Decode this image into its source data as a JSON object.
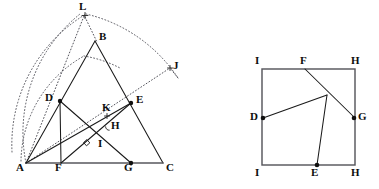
{
  "figure": {
    "width": 379,
    "height": 189,
    "background_color": "#ffffff",
    "line_color": "#1a1a1a",
    "dotted_color": "#4a4a52",
    "edge_color": "#57575d",
    "marker_color": "#101010"
  },
  "left_panel": {
    "name": "triangle-construction",
    "description": "Triangle ABC with interior cevians, dotted circular arcs centred at A, and construction points",
    "points": [
      {
        "id": "A",
        "label": "A",
        "x": 26,
        "y": 163,
        "marker": "none",
        "label_x": 16,
        "label_y": 166
      },
      {
        "id": "B",
        "label": "B",
        "x": 95,
        "y": 41,
        "marker": "none",
        "label_x": 99,
        "label_y": 35
      },
      {
        "id": "C",
        "label": "C",
        "x": 163,
        "y": 163,
        "marker": "none",
        "label_x": 166,
        "label_y": 166
      },
      {
        "id": "D",
        "label": "D",
        "x": 60,
        "y": 101,
        "marker": "dot",
        "label_x": 46,
        "label_y": 96
      },
      {
        "id": "E",
        "label": "E",
        "x": 131,
        "y": 103,
        "marker": "dot",
        "label_x": 136,
        "label_y": 98
      },
      {
        "id": "F",
        "label": "F",
        "x": 61,
        "y": 163,
        "marker": "none",
        "label_x": 55,
        "label_y": 166
      },
      {
        "id": "G",
        "label": "G",
        "x": 131,
        "y": 163,
        "marker": "dot",
        "label_x": 125,
        "label_y": 166
      },
      {
        "id": "H",
        "label": "H",
        "x": 110,
        "y": 128,
        "marker": "none",
        "label_x": 112,
        "label_y": 124
      },
      {
        "id": "I",
        "label": "I",
        "x": 101,
        "y": 150,
        "marker": "none",
        "label_x": 99,
        "label_y": 143
      },
      {
        "id": "K",
        "label": "K",
        "x": 107,
        "y": 116,
        "marker": "cross",
        "label_x": 103,
        "label_y": 105
      },
      {
        "id": "L",
        "label": "L",
        "x": 85,
        "y": 15,
        "marker": "cross",
        "label_x": 80,
        "label_y": 3
      },
      {
        "id": "J",
        "label": "J",
        "x": 170,
        "y": 68,
        "marker": "cross",
        "label_x": 173,
        "label_y": 63
      }
    ],
    "solid_segments": [
      {
        "name": "side-AB",
        "from": "A",
        "to": "B"
      },
      {
        "name": "side-BC",
        "from": "B",
        "to": "C"
      },
      {
        "name": "cevian-D-G",
        "from": "D",
        "to": "G"
      },
      {
        "name": "cevian-E-F",
        "from": "E",
        "to": "F"
      },
      {
        "name": "segment-D-F",
        "from": "D",
        "to": "F"
      },
      {
        "name": "segment-A-E",
        "from": "A",
        "to": "E"
      }
    ],
    "base_segment": {
      "name": "side-AC",
      "from": "A",
      "to": "C"
    },
    "dotted_segments": [
      {
        "name": "ray-A-to-L",
        "from": "A",
        "to": "L"
      },
      {
        "name": "ray-A-through-K-E-to-J",
        "from": "A",
        "to": "J"
      },
      {
        "name": "chord-L-to-B-region",
        "from": "L",
        "to": "B"
      }
    ],
    "dotted_arcs": [
      {
        "name": "arc-large-centred-A-through-L",
        "center": "A",
        "radius": 152,
        "start_deg": 185,
        "end_deg": 48
      },
      {
        "name": "arc-small-centred-A-through-D",
        "center": "A",
        "radius": 122,
        "start_deg": 188,
        "end_deg": 70
      },
      {
        "name": "arc-outer-through-J",
        "center": "A",
        "radius": 152,
        "start_deg": 40,
        "end_deg": 24
      }
    ],
    "angle_marks": [
      {
        "name": "right-angle-at-intersection",
        "x": 86,
        "y": 143,
        "kind": "square"
      },
      {
        "name": "angle-arc-at-H",
        "x": 108,
        "y": 127,
        "kind": "arc"
      }
    ]
  },
  "right_panel": {
    "name": "square-construction",
    "description": "Square I H H I with interior segments meeting at a junction point; labelled points D, E, F, G on the edges",
    "square": {
      "left": 262,
      "top": 69,
      "right": 355,
      "bottom": 165,
      "corner_labels": [
        {
          "id": "I-top",
          "label": "I",
          "x": 262,
          "y": 69,
          "label_x": 255,
          "label_y": 57
        },
        {
          "id": "H-top",
          "label": "H",
          "x": 355,
          "y": 69,
          "label_x": 352,
          "label_y": 57
        },
        {
          "id": "I-bottom",
          "label": "I",
          "x": 262,
          "y": 165,
          "label_x": 255,
          "label_y": 168
        },
        {
          "id": "H-bottom",
          "label": "H",
          "x": 355,
          "y": 165,
          "label_x": 352,
          "label_y": 168
        }
      ]
    },
    "points": [
      {
        "id": "F",
        "label": "F",
        "x": 305,
        "y": 69,
        "marker": "none",
        "label_x": 300,
        "label_y": 57
      },
      {
        "id": "D",
        "label": "D",
        "x": 263,
        "y": 118,
        "marker": "dot",
        "label_x": 250,
        "label_y": 114
      },
      {
        "id": "G",
        "label": "G",
        "x": 355,
        "y": 118,
        "marker": "dot",
        "label_x": 359,
        "label_y": 114
      },
      {
        "id": "E",
        "label": "E",
        "x": 317,
        "y": 165,
        "marker": "dot",
        "label_x": 311,
        "label_y": 168
      },
      {
        "id": "P",
        "label": "",
        "x": 327,
        "y": 95,
        "marker": "none",
        "label_x": 0,
        "label_y": 0
      }
    ],
    "solid_segments": [
      {
        "name": "segment-F-to-G",
        "from": "F",
        "to": "G"
      },
      {
        "name": "segment-D-to-junction",
        "from": "D",
        "to": "P"
      },
      {
        "name": "segment-E-to-junction",
        "from": "E",
        "to": "P"
      }
    ]
  }
}
